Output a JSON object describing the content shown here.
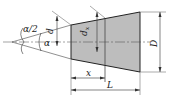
{
  "diagram": {
    "colors": {
      "fill": "#bdbdbd",
      "line": "#222222",
      "thin_line": "#555555",
      "background": "#ffffff"
    },
    "labels": {
      "half_angle": "α/2",
      "angle": "α",
      "small_diameter": "d",
      "section_diameter": "d",
      "section_diameter_sub": "x",
      "large_diameter": "D",
      "position": "x",
      "length": "L"
    }
  }
}
